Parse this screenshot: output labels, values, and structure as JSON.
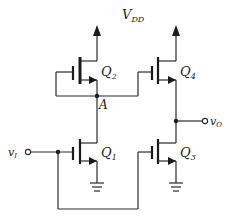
{
  "diagram": {
    "type": "circuit-schematic",
    "supply_label": "V",
    "supply_sub": "DD",
    "input_label": "v",
    "input_sub": "I",
    "output_label": "v",
    "output_sub": "O",
    "node_label": "A",
    "transistors": [
      {
        "id": "Q2",
        "label": "Q",
        "sub": "2",
        "type": "NMOS",
        "role": "load"
      },
      {
        "id": "Q4",
        "label": "Q",
        "sub": "4",
        "type": "NMOS",
        "role": "output-pullup"
      },
      {
        "id": "Q1",
        "label": "Q",
        "sub": "1",
        "type": "NMOS",
        "role": "driver"
      },
      {
        "id": "Q3",
        "label": "Q",
        "sub": "3",
        "type": "NMOS",
        "role": "output-pulldown"
      }
    ],
    "colors": {
      "line": "#2a2a2a",
      "background": "#ffffff"
    }
  }
}
